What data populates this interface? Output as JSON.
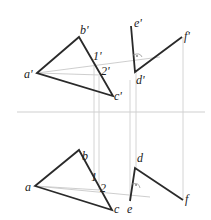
{
  "colors": {
    "object_line": "#2a2a2a",
    "construction_line": "#c8c8c8",
    "axis_line": "#cfcfcf",
    "label": "#222222",
    "background": "#ffffff"
  },
  "frontal_view": {
    "labels": {
      "a": "a'",
      "b": "b'",
      "c": "c'",
      "p1": "1'",
      "p2": "2'",
      "d": "d'",
      "e": "e'",
      "f": "f'"
    }
  },
  "horizontal_view": {
    "labels": {
      "a": "a",
      "b": "b",
      "c": "c",
      "p1": "1",
      "p2": "2",
      "d": "d",
      "e": "e",
      "f": "f"
    }
  }
}
